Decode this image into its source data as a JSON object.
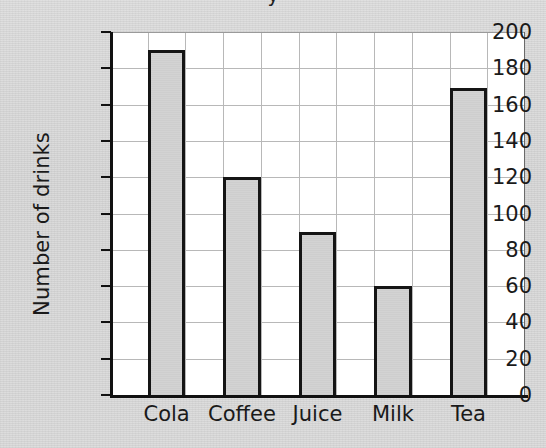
{
  "figure": {
    "title_fragment": "y",
    "background_color": "#d8d8d8",
    "plot_background_color": "#ffffff",
    "bar_fill_color": "#d2d2d2",
    "bar_border_color": "#151515",
    "gridline_color": "#b8b8b8",
    "axis_color": "#111111"
  },
  "chart_data": {
    "type": "bar",
    "title": "",
    "xlabel": "",
    "ylabel": "Number of drinks",
    "categories": [
      "Cola",
      "Coffee",
      "Juice",
      "Milk",
      "Tea"
    ],
    "values": [
      190,
      120,
      90,
      60,
      169
    ],
    "ylim": [
      0,
      200
    ],
    "ytick_step": 20,
    "yticks": [
      0,
      20,
      40,
      60,
      80,
      100,
      120,
      140,
      160,
      180,
      200
    ],
    "ytick_labels": [
      "0",
      "20",
      "40",
      "60",
      "80",
      "100",
      "120",
      "140",
      "160",
      "180",
      "200"
    ],
    "grid": true,
    "grid_horizontal": true,
    "grid_vertical": true,
    "vertical_grid_columns": 11,
    "legend": null,
    "legend_position": "none",
    "annotations": []
  }
}
